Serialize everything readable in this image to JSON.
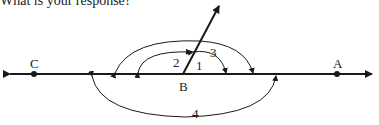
{
  "caption": "What is your response?",
  "diagram": {
    "points": [
      {
        "id": "C",
        "label": "C"
      },
      {
        "id": "B",
        "label": "B"
      },
      {
        "id": "A",
        "label": "A"
      }
    ],
    "angles": [
      {
        "id": "1",
        "label": "1"
      },
      {
        "id": "2",
        "label": "2"
      },
      {
        "id": "3",
        "label": "3"
      },
      {
        "id": "4",
        "label": "4"
      }
    ],
    "stroke_color": "#1a1a1a"
  }
}
